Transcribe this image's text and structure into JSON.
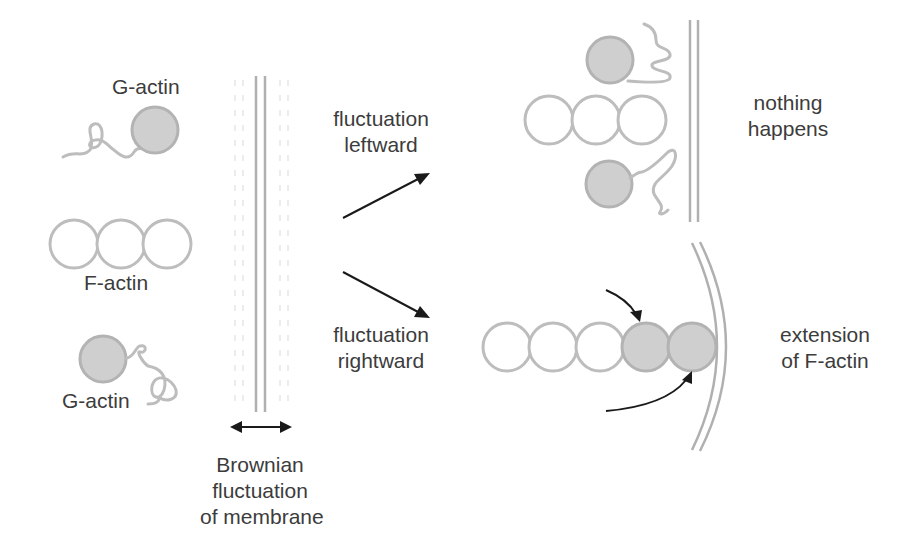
{
  "diagram": {
    "colors": {
      "monomer_fill": "#cfcfcf",
      "monomer_stroke": "#b3b3b3",
      "filament_stroke": "#bdbdbd",
      "membrane_stroke": "#b0b0b0",
      "arrow": "#1a1a1a",
      "text": "#3c3c3c"
    },
    "labels": {
      "g_actin_top": "G-actin",
      "f_actin": "F-actin",
      "g_actin_bottom": "G-actin",
      "membrane_caption": [
        "Brownian",
        "fluctuation",
        "of membrane"
      ],
      "leftward": [
        "fluctuation",
        "leftward"
      ],
      "rightward": [
        "fluctuation",
        "rightward"
      ],
      "outcome_top": [
        "nothing",
        "happens"
      ],
      "outcome_bottom": [
        "extension",
        "of F-actin"
      ]
    },
    "panels": [
      {
        "name": "initial-state",
        "filament_subunits": 3,
        "free_monomers": 2
      },
      {
        "name": "leftward-outcome",
        "filament_subunits": 3,
        "free_monomers": 2,
        "result": "nothing happens"
      },
      {
        "name": "rightward-outcome",
        "filament_subunits": 5,
        "added_subunits": 2,
        "result": "extension of F-actin"
      }
    ]
  }
}
